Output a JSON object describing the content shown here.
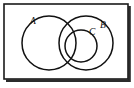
{
  "figure": {
    "background_color": "#ffffff",
    "stroke_color": "#111111",
    "frame": {
      "x": 4,
      "y": 4,
      "width": 124,
      "height": 75,
      "border_color": "#1a1a1a",
      "shadow_color": "#2b2b2b"
    },
    "sets": [
      {
        "id": "A",
        "label": "A",
        "cx": 49,
        "cy": 43,
        "r": 27,
        "label_x": 30,
        "label_y": 24
      },
      {
        "id": "B",
        "label": "B",
        "cx": 86,
        "cy": 43,
        "r": 27,
        "label_x": 100,
        "label_y": 28
      },
      {
        "id": "C",
        "label": "C",
        "cx": 81,
        "cy": 46,
        "r": 16,
        "label_x": 89,
        "label_y": 35
      }
    ]
  }
}
